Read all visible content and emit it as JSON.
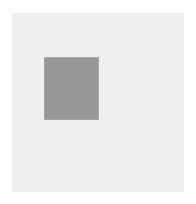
{
  "graphic": {
    "type": "geometric-swatch",
    "canvas": {
      "width": 196,
      "height": 204,
      "background_color": "#ffffff"
    },
    "panel": {
      "name": "light-backing-panel",
      "fill_color": "#efefef",
      "x": 12,
      "y": 13,
      "width": 172,
      "height": 179
    },
    "swatch": {
      "name": "gray-filled-rectangle",
      "fill_color": "#989898",
      "edge_color": "#a8a8a8",
      "x": 45,
      "y": 58,
      "width": 53,
      "height": 61
    },
    "text_content": "",
    "labels": []
  }
}
